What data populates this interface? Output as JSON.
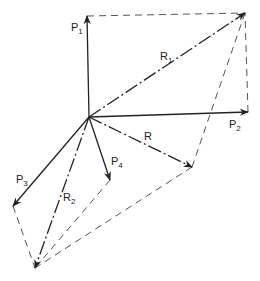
{
  "diagram": {
    "type": "vector-force-diagram",
    "origin": {
      "x": 89,
      "y": 117
    },
    "colors": {
      "line": "#222222",
      "construction": "#555555",
      "background": "#ffffff"
    },
    "vectors": [
      {
        "id": "P1",
        "label": "P",
        "sub": "1",
        "from": [
          89,
          117
        ],
        "to": [
          87,
          16
        ],
        "style": "solid"
      },
      {
        "id": "P2",
        "label": "P",
        "sub": "2",
        "from": [
          89,
          117
        ],
        "to": [
          248,
          112
        ],
        "style": "solid"
      },
      {
        "id": "P3",
        "label": "P",
        "sub": "3",
        "from": [
          89,
          117
        ],
        "to": [
          13,
          206
        ],
        "style": "solid"
      },
      {
        "id": "P4",
        "label": "P",
        "sub": "4",
        "from": [
          89,
          117
        ],
        "to": [
          110,
          180
        ],
        "style": "solid"
      },
      {
        "id": "R1",
        "label": "R",
        "sub": "1",
        "from": [
          89,
          117
        ],
        "to": [
          245,
          13
        ],
        "style": "dash-dot"
      },
      {
        "id": "R2",
        "label": "R",
        "sub": "2",
        "from": [
          89,
          117
        ],
        "to": [
          35,
          268
        ],
        "style": "dash-dot"
      },
      {
        "id": "R",
        "label": "R",
        "sub": "",
        "from": [
          89,
          117
        ],
        "to": [
          192,
          167
        ],
        "style": "dash-dot"
      }
    ],
    "labels": {
      "p1": {
        "main": "P",
        "sub": "1"
      },
      "p2": {
        "main": "P",
        "sub": "2"
      },
      "p3": {
        "main": "P",
        "sub": "3"
      },
      "p4": {
        "main": "P",
        "sub": "4"
      },
      "r1": {
        "main": "R",
        "sub": "1"
      },
      "r2": {
        "main": "R",
        "sub": "2"
      },
      "r": {
        "main": "R"
      }
    }
  }
}
